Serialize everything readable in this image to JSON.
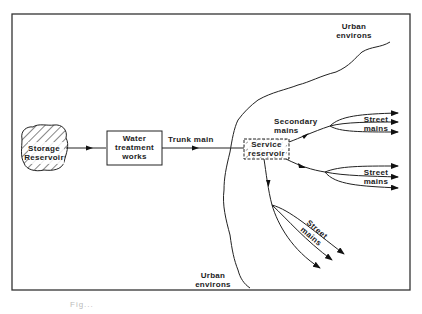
{
  "diagram": {
    "type": "water-supply-flow",
    "nodes": {
      "storage_reservoir": {
        "line1": "Storage",
        "line2": "Reservoir"
      },
      "treatment_works": {
        "line1": "Water",
        "line2": "treatment",
        "line3": "works"
      },
      "service_reservoir": {
        "line1": "Service",
        "line2": "reservoir"
      }
    },
    "edges": {
      "trunk_main": "Trunk main",
      "secondary_mains": {
        "line1": "Secondary",
        "line2": "mains"
      },
      "street_mains": {
        "line1": "Street",
        "line2": "mains"
      }
    },
    "regions": {
      "urban_top": {
        "line1": "Urban",
        "line2": "environs"
      },
      "urban_bottom": {
        "line1": "Urban",
        "line2": "environs"
      }
    },
    "colors": {
      "ink": "#222222",
      "frame": "#333333",
      "background": "#ffffff"
    }
  },
  "caption": "Fig..."
}
